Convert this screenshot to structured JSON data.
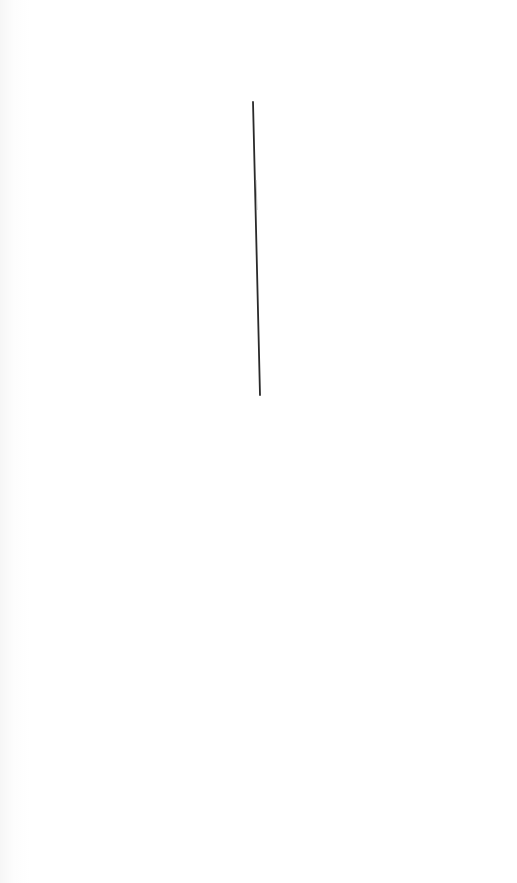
{
  "image": {
    "description": "Plain white surface with a single thin dark vertical line (pin-like) slightly tilted",
    "background_color": "#ffffff",
    "line": {
      "color": "#2a2a2a",
      "start": [
        253,
        102
      ],
      "end": [
        260,
        395
      ],
      "width": 1.8
    }
  }
}
